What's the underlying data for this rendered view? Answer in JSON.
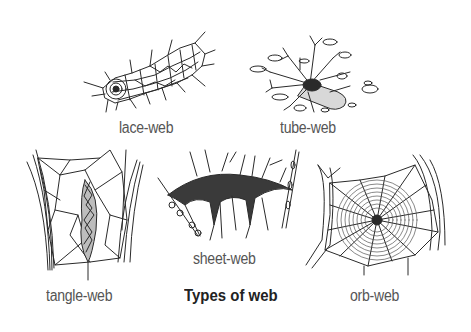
{
  "figure": {
    "title": "Types of web",
    "webs": [
      {
        "id": "lace",
        "label": "lace-web"
      },
      {
        "id": "tube",
        "label": "tube-web"
      },
      {
        "id": "tangle",
        "label": "tangle-web"
      },
      {
        "id": "sheet",
        "label": "sheet-web"
      },
      {
        "id": "orb",
        "label": "orb-web"
      }
    ]
  },
  "colors": {
    "background": "#ffffff",
    "ink": "#2a2a2a",
    "label": "#555555",
    "title": "#222222"
  }
}
